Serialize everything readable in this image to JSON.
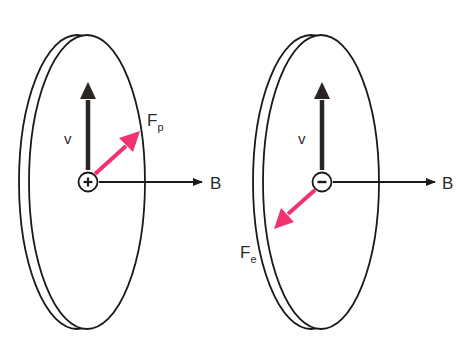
{
  "diagram": {
    "colors": {
      "stroke": "#1a1a1a",
      "force": "#f0336e",
      "background": "#ffffff"
    },
    "left_panel": {
      "charge_symbol": "+",
      "charge_type": "positive",
      "velocity_label": "v",
      "field_label": "B",
      "force_label": "F",
      "force_subscript": "p"
    },
    "right_panel": {
      "charge_symbol": "−",
      "charge_type": "negative",
      "velocity_label": "v",
      "field_label": "B",
      "force_label": "F",
      "force_subscript": "e"
    }
  }
}
